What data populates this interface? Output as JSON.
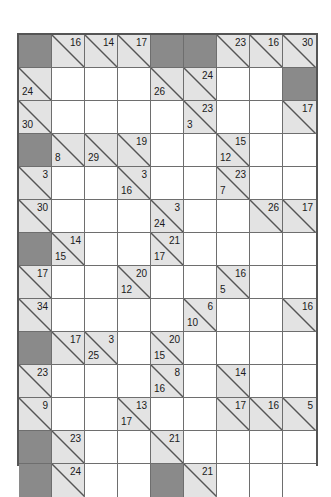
{
  "puzzle": {
    "name": "kakuro-grid",
    "type": "kakuro",
    "rows": 14,
    "cols": 9,
    "colors": {
      "block": "#8a8a8a",
      "clue": "#e3e3e3",
      "white": "#ffffff",
      "line": "#6e6e6e",
      "border": "#555555",
      "text": "#1a1a1a"
    },
    "cells": [
      [
        {
          "t": "block"
        },
        {
          "t": "clue",
          "down": "16"
        },
        {
          "t": "clue",
          "down": "14"
        },
        {
          "t": "clue",
          "down": "17"
        },
        {
          "t": "block"
        },
        {
          "t": "block"
        },
        {
          "t": "clue",
          "down": "23"
        },
        {
          "t": "clue",
          "down": "16"
        },
        {
          "t": "clue",
          "down": "30"
        }
      ],
      [
        {
          "t": "clue",
          "across": "24"
        },
        {
          "t": "white"
        },
        {
          "t": "white"
        },
        {
          "t": "white"
        },
        {
          "t": "clue",
          "across": "26"
        },
        {
          "t": "clue",
          "down": "24"
        },
        {
          "t": "white"
        },
        {
          "t": "white"
        },
        {
          "t": "block"
        }
      ],
      [
        {
          "t": "clue",
          "across": "30"
        },
        {
          "t": "white"
        },
        {
          "t": "white"
        },
        {
          "t": "white"
        },
        {
          "t": "white"
        },
        {
          "t": "clue",
          "down": "23",
          "across": "3"
        },
        {
          "t": "white"
        },
        {
          "t": "white"
        },
        {
          "t": "clue",
          "down": "17"
        }
      ],
      [
        {
          "t": "block"
        },
        {
          "t": "clue",
          "across": "8"
        },
        {
          "t": "clue",
          "across": "29"
        },
        {
          "t": "clue",
          "down": "19"
        },
        {
          "t": "white"
        },
        {
          "t": "white"
        },
        {
          "t": "clue",
          "down": "15",
          "across": "12"
        },
        {
          "t": "white"
        },
        {
          "t": "white"
        }
      ],
      [
        {
          "t": "clue",
          "down": "3"
        },
        {
          "t": "white"
        },
        {
          "t": "white"
        },
        {
          "t": "clue",
          "down": "3",
          "across": "16"
        },
        {
          "t": "white"
        },
        {
          "t": "white"
        },
        {
          "t": "clue",
          "down": "23",
          "across": "7"
        },
        {
          "t": "white"
        },
        {
          "t": "white"
        }
      ],
      [
        {
          "t": "clue",
          "down": "30"
        },
        {
          "t": "white"
        },
        {
          "t": "white"
        },
        {
          "t": "white"
        },
        {
          "t": "clue",
          "down": "3",
          "across": "24"
        },
        {
          "t": "white"
        },
        {
          "t": "white"
        },
        {
          "t": "clue",
          "down": "26"
        },
        {
          "t": "clue",
          "down": "17"
        }
      ],
      [
        {
          "t": "block"
        },
        {
          "t": "clue",
          "down": "14",
          "across": "15"
        },
        {
          "t": "white"
        },
        {
          "t": "white"
        },
        {
          "t": "clue",
          "down": "21",
          "across": "17"
        },
        {
          "t": "white"
        },
        {
          "t": "white"
        },
        {
          "t": "white"
        },
        {
          "t": "white"
        }
      ],
      [
        {
          "t": "clue",
          "down": "17"
        },
        {
          "t": "white"
        },
        {
          "t": "white"
        },
        {
          "t": "clue",
          "down": "20",
          "across": "12"
        },
        {
          "t": "white"
        },
        {
          "t": "white"
        },
        {
          "t": "clue",
          "down": "16",
          "across": "5"
        },
        {
          "t": "white"
        },
        {
          "t": "white"
        }
      ],
      [
        {
          "t": "clue",
          "down": "34"
        },
        {
          "t": "white"
        },
        {
          "t": "white"
        },
        {
          "t": "white"
        },
        {
          "t": "white"
        },
        {
          "t": "clue",
          "down": "6",
          "across": "10"
        },
        {
          "t": "white"
        },
        {
          "t": "white"
        },
        {
          "t": "clue",
          "down": "16"
        }
      ],
      [
        {
          "t": "block"
        },
        {
          "t": "clue",
          "down": "17"
        },
        {
          "t": "clue",
          "down": "3",
          "across": "25"
        },
        {
          "t": "white"
        },
        {
          "t": "clue",
          "down": "20",
          "across": "15"
        },
        {
          "t": "white"
        },
        {
          "t": "white"
        },
        {
          "t": "white"
        },
        {
          "t": "white"
        }
      ],
      [
        {
          "t": "clue",
          "down": "23"
        },
        {
          "t": "white"
        },
        {
          "t": "white"
        },
        {
          "t": "white"
        },
        {
          "t": "clue",
          "down": "8",
          "across": "16"
        },
        {
          "t": "white"
        },
        {
          "t": "clue",
          "down": "14"
        },
        {
          "t": "white"
        },
        {
          "t": "white"
        }
      ],
      [
        {
          "t": "clue",
          "down": "9"
        },
        {
          "t": "white"
        },
        {
          "t": "white"
        },
        {
          "t": "clue",
          "down": "13",
          "across": "17"
        },
        {
          "t": "white"
        },
        {
          "t": "white"
        },
        {
          "t": "clue",
          "down": "17"
        },
        {
          "t": "clue",
          "down": "16"
        },
        {
          "t": "clue",
          "down": "5"
        }
      ],
      [
        {
          "t": "block"
        },
        {
          "t": "clue",
          "down": "23"
        },
        {
          "t": "white"
        },
        {
          "t": "white"
        },
        {
          "t": "clue",
          "down": "21"
        },
        {
          "t": "white"
        },
        {
          "t": "white"
        },
        {
          "t": "white"
        },
        {
          "t": "white"
        }
      ],
      [
        {
          "t": "block"
        },
        {
          "t": "clue",
          "down": "24"
        },
        {
          "t": "white"
        },
        {
          "t": "white"
        },
        {
          "t": "block"
        },
        {
          "t": "clue",
          "down": "21"
        },
        {
          "t": "white"
        },
        {
          "t": "white"
        },
        {
          "t": "white"
        }
      ]
    ]
  }
}
